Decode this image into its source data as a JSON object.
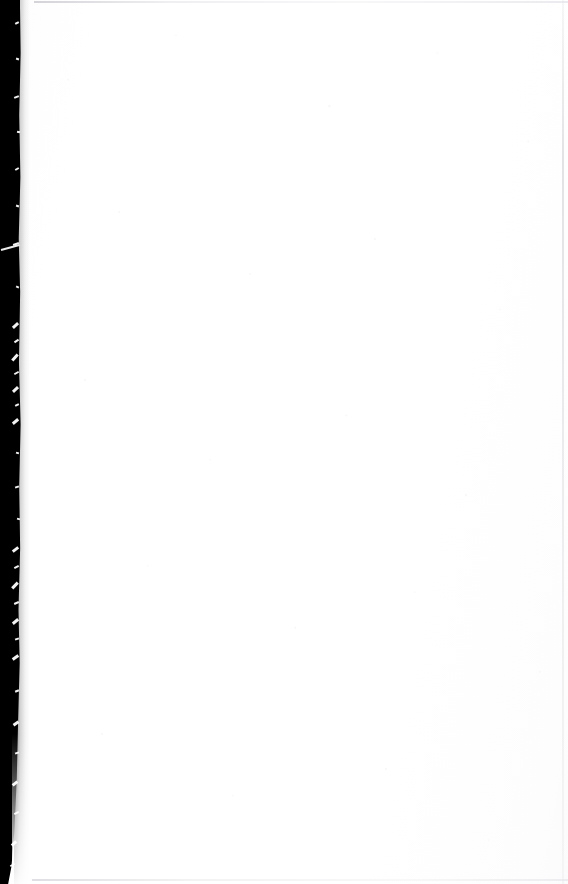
{
  "page": {
    "kind": "scanned-blank-page",
    "width": 568,
    "height": 884,
    "orientation": "portrait",
    "visible_text": "",
    "has_text": false,
    "has_figures": false
  },
  "colors": {
    "paper_white": "#FFFFFF",
    "paper_tint": "#FDFDFE",
    "grain_speckle": "#F4F4F7",
    "gutter_black": "#000000",
    "edge_hairline": "#E8E8EA",
    "fleck_white": "#FFFFFF"
  },
  "regions": {
    "content_area": {
      "label": "blank page field",
      "x": 24,
      "y": 0,
      "width": 544,
      "height": 884,
      "fill": "#FFFFFF"
    },
    "binding_gutter": {
      "label": "left binding gutter shadow",
      "x": 0,
      "y": 0,
      "width_top": 20,
      "width_middle": 18,
      "width_bottom": 12,
      "height": 884,
      "fill": "#000000",
      "edge": "ragged, flecked with white paper-fiber artifacts"
    },
    "page_edges": {
      "top_hairline_y": 2,
      "right_hairline_x": 563,
      "bottom_hairline_y": 880,
      "fill": "#E8E8EA"
    }
  },
  "artifacts": {
    "diagonal_streak": {
      "x": 1,
      "y": 249,
      "length": 19,
      "angle_deg": -15
    },
    "fleck_clusters": [
      {
        "from_y": 320,
        "to_y": 430,
        "density": "high"
      },
      {
        "from_y": 540,
        "to_y": 660,
        "density": "high"
      },
      {
        "from_y": 700,
        "to_y": 860,
        "density": "medium"
      }
    ],
    "fleck_positions": [
      {
        "x": 15,
        "y": 22,
        "w": 4,
        "h": 2,
        "r": -28
      },
      {
        "x": 16,
        "y": 58,
        "w": 3,
        "h": 2,
        "r": 18
      },
      {
        "x": 14,
        "y": 96,
        "w": 5,
        "h": 2,
        "r": -22
      },
      {
        "x": 17,
        "y": 131,
        "w": 3,
        "h": 2,
        "r": 12
      },
      {
        "x": 15,
        "y": 168,
        "w": 4,
        "h": 2,
        "r": -30
      },
      {
        "x": 16,
        "y": 205,
        "w": 3,
        "h": 2,
        "r": 20
      },
      {
        "x": 13,
        "y": 243,
        "w": 6,
        "h": 2,
        "r": -18
      },
      {
        "x": 16,
        "y": 286,
        "w": 3,
        "h": 2,
        "r": 24
      },
      {
        "x": 12,
        "y": 324,
        "w": 7,
        "h": 3,
        "r": -42
      },
      {
        "x": 14,
        "y": 340,
        "w": 5,
        "h": 2,
        "r": -35
      },
      {
        "x": 11,
        "y": 356,
        "w": 8,
        "h": 3,
        "r": -48
      },
      {
        "x": 14,
        "y": 372,
        "w": 5,
        "h": 2,
        "r": -30
      },
      {
        "x": 12,
        "y": 388,
        "w": 7,
        "h": 3,
        "r": -44
      },
      {
        "x": 15,
        "y": 404,
        "w": 4,
        "h": 2,
        "r": -26
      },
      {
        "x": 12,
        "y": 420,
        "w": 7,
        "h": 3,
        "r": -40
      },
      {
        "x": 16,
        "y": 452,
        "w": 3,
        "h": 2,
        "r": 16
      },
      {
        "x": 15,
        "y": 486,
        "w": 4,
        "h": 2,
        "r": -20
      },
      {
        "x": 17,
        "y": 518,
        "w": 3,
        "h": 2,
        "r": 14
      },
      {
        "x": 12,
        "y": 548,
        "w": 7,
        "h": 3,
        "r": -38
      },
      {
        "x": 14,
        "y": 566,
        "w": 5,
        "h": 2,
        "r": -28
      },
      {
        "x": 11,
        "y": 584,
        "w": 8,
        "h": 3,
        "r": -46
      },
      {
        "x": 14,
        "y": 602,
        "w": 5,
        "h": 2,
        "r": -24
      },
      {
        "x": 12,
        "y": 620,
        "w": 7,
        "h": 3,
        "r": -40
      },
      {
        "x": 15,
        "y": 638,
        "w": 4,
        "h": 2,
        "r": -18
      },
      {
        "x": 12,
        "y": 656,
        "w": 7,
        "h": 3,
        "r": -36
      },
      {
        "x": 15,
        "y": 690,
        "w": 4,
        "h": 2,
        "r": -22
      },
      {
        "x": 13,
        "y": 722,
        "w": 6,
        "h": 3,
        "r": -34
      },
      {
        "x": 15,
        "y": 752,
        "w": 4,
        "h": 2,
        "r": -20
      },
      {
        "x": 12,
        "y": 782,
        "w": 6,
        "h": 3,
        "r": -38
      },
      {
        "x": 14,
        "y": 812,
        "w": 5,
        "h": 2,
        "r": -26
      },
      {
        "x": 11,
        "y": 842,
        "w": 6,
        "h": 3,
        "r": -44
      },
      {
        "x": 10,
        "y": 864,
        "w": 5,
        "h": 2,
        "r": -30
      }
    ]
  }
}
